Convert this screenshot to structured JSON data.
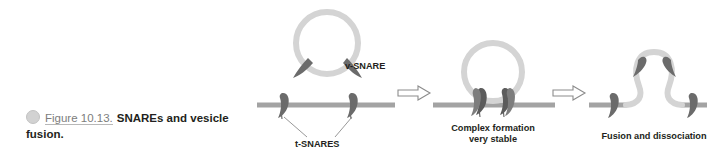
{
  "caption": {
    "bullet_icon": "circle-bullet-icon",
    "figure_number": "Figure 10.13.",
    "text": "SNAREs and vesicle fusion."
  },
  "diagram": {
    "labels": {
      "v_snare": "v-SNARE",
      "t_snare": "t-SNARES",
      "panel2_line1": "Complex formation",
      "panel2_line2": "very stable",
      "panel3": "Fusion and dissociation"
    },
    "arrows": {
      "arrow1_icon": "block-arrow-right-icon",
      "arrow2_icon": "block-arrow-right-icon"
    },
    "colors": {
      "membrane": "#a3a3a3",
      "vesicle": "#d4d4d4",
      "snare_protein": "#6b6b6b",
      "snare_protein_dark": "#4f4f4f",
      "arrow_stroke": "#8c8c8c",
      "text": "#231f20",
      "figure_number": "#7d7d7d",
      "bullet": "#d2d2d2"
    },
    "panels": [
      {
        "name": "docking",
        "icons": [
          "vesicle-icon",
          "v-snare-icon",
          "membrane-icon",
          "t-snare-icon"
        ]
      },
      {
        "name": "complex-formation",
        "icons": [
          "vesicle-icon",
          "snare-complex-icon",
          "membrane-icon"
        ]
      },
      {
        "name": "fusion-dissociation",
        "icons": [
          "fusion-pore-icon",
          "snare-icon",
          "membrane-icon"
        ]
      }
    ]
  }
}
